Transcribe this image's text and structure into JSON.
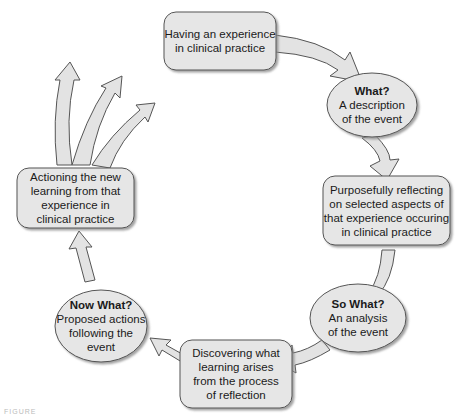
{
  "diagram": {
    "type": "cycle",
    "colors": {
      "fill": "#e6e6e6",
      "stroke": "#555555",
      "shadow": "#9a9a9a",
      "text": "#1a1a1a"
    },
    "nodes": [
      {
        "id": "experience",
        "shape": "rounded-rect",
        "lines": [
          "Having an experience",
          "in clinical practice"
        ]
      },
      {
        "id": "what",
        "shape": "ellipse",
        "title": "What?",
        "lines": [
          "A description",
          "of the event"
        ]
      },
      {
        "id": "reflecting",
        "shape": "rounded-rect",
        "lines": [
          "Purposefully reflecting",
          "on selected aspects of",
          "that experience occuring",
          "in clinical practice"
        ]
      },
      {
        "id": "so-what",
        "shape": "ellipse",
        "title": "So What?",
        "lines": [
          "An analysis",
          "of the event"
        ]
      },
      {
        "id": "discovering",
        "shape": "rounded-rect",
        "lines": [
          "Discovering what",
          "learning arises",
          "from the process",
          "of reflection"
        ]
      },
      {
        "id": "now-what",
        "shape": "ellipse",
        "title": "Now What?",
        "lines": [
          "Proposed actions",
          "following the",
          "event"
        ]
      },
      {
        "id": "actioning",
        "shape": "rounded-rect",
        "lines": [
          "Actioning the new",
          "learning from that",
          "experience in",
          "clinical practice"
        ]
      }
    ],
    "edges": [
      [
        "experience",
        "what"
      ],
      [
        "what",
        "reflecting"
      ],
      [
        "reflecting",
        "so-what"
      ],
      [
        "so-what",
        "discovering"
      ],
      [
        "discovering",
        "now-what"
      ],
      [
        "now-what",
        "actioning"
      ]
    ],
    "outgoing_arrows_from_actioning": 3
  },
  "caption": "FIGURE"
}
